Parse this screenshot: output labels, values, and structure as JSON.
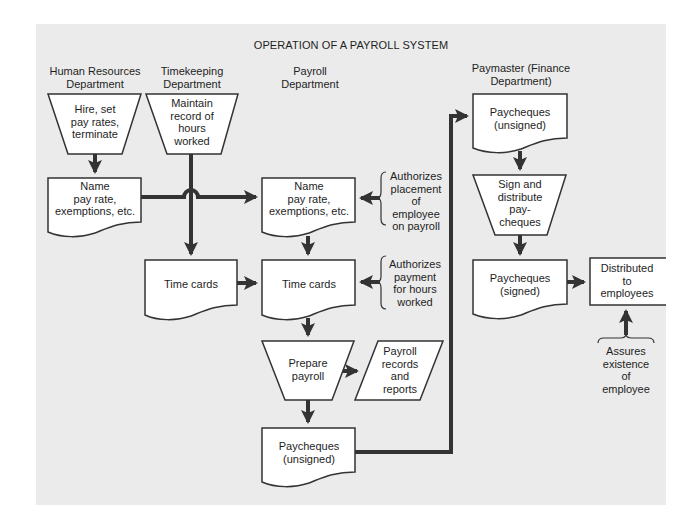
{
  "title": "OPERATION OF A PAYROLL SYSTEM",
  "colors": {
    "background": "#ebebeb",
    "shape_fill": "#ffffff",
    "stroke": "#333333",
    "text": "#1e1e1e"
  },
  "departments": {
    "hr": [
      "Human Resources",
      "Department"
    ],
    "timekeeping": [
      "Timekeeping",
      "Department"
    ],
    "payroll": [
      "Payroll",
      "Department"
    ],
    "paymaster": [
      "Paymaster (Finance",
      "Department)"
    ]
  },
  "nodes": {
    "hr_hire": {
      "shape": "manual-operation",
      "lines": [
        "Hire, set",
        "pay rates,",
        "terminate"
      ]
    },
    "tk_maintain": {
      "shape": "manual-operation",
      "lines": [
        "Maintain",
        "record of",
        "hours",
        "worked"
      ]
    },
    "hr_name_doc": {
      "shape": "document",
      "lines": [
        "Name",
        "pay rate,",
        "exemptions, etc."
      ]
    },
    "tk_timecards": {
      "shape": "document",
      "lines": [
        "Time cards"
      ]
    },
    "pr_name_doc": {
      "shape": "document",
      "lines": [
        "Name",
        "pay rate,",
        "exemptions, etc."
      ]
    },
    "pr_timecards": {
      "shape": "document",
      "lines": [
        "Time cards"
      ]
    },
    "pr_prepare": {
      "shape": "manual-operation",
      "lines": [
        "Prepare",
        "payroll"
      ]
    },
    "pr_records": {
      "shape": "data",
      "lines": [
        "Payroll",
        "records",
        "and",
        "reports"
      ]
    },
    "pr_paycheques": {
      "shape": "document",
      "lines": [
        "Paycheques",
        "(unsigned)"
      ]
    },
    "pm_paycheques_unsigned": {
      "shape": "document",
      "lines": [
        "Paycheques",
        "(unsigned)"
      ]
    },
    "pm_sign": {
      "shape": "manual-operation",
      "lines": [
        "Sign and",
        "distribute",
        "pay-",
        "cheques"
      ]
    },
    "pm_paycheques_signed": {
      "shape": "document",
      "lines": [
        "Paycheques",
        "(signed)"
      ]
    },
    "distributed": {
      "shape": "terminal-box",
      "lines": [
        "Distributed",
        "to",
        "employees"
      ]
    }
  },
  "annotations": {
    "authorizes_placement": [
      "Authorizes",
      "placement",
      "of",
      "employee",
      "on payroll"
    ],
    "authorizes_payment": [
      "Authorizes",
      "payment",
      "for hours",
      "worked"
    ],
    "assures_existence": [
      "Assures",
      "existence",
      "of",
      "employee"
    ]
  },
  "edges": [
    [
      "hr_hire",
      "hr_name_doc"
    ],
    [
      "hr_name_doc",
      "pr_name_doc"
    ],
    [
      "tk_maintain",
      "tk_timecards"
    ],
    [
      "tk_timecards",
      "pr_timecards"
    ],
    [
      "pr_name_doc",
      "pr_timecards"
    ],
    [
      "pr_timecards",
      "pr_prepare"
    ],
    [
      "pr_prepare",
      "pr_records"
    ],
    [
      "pr_prepare",
      "pr_paycheques"
    ],
    [
      "pr_paycheques",
      "pm_paycheques_unsigned"
    ],
    [
      "pm_paycheques_unsigned",
      "pm_sign"
    ],
    [
      "pm_sign",
      "pm_paycheques_signed"
    ],
    [
      "pm_paycheques_signed",
      "distributed"
    ],
    [
      "authorizes_placement",
      "pr_name_doc"
    ],
    [
      "authorizes_payment",
      "pr_timecards"
    ],
    [
      "assures_existence",
      "distributed"
    ]
  ]
}
